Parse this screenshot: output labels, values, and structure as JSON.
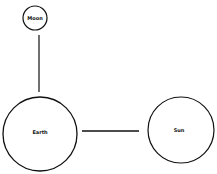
{
  "diagram": {
    "nodes": [
      {
        "id": "moon",
        "label": "Moon",
        "cx": 35,
        "cy": 18,
        "r": 12
      },
      {
        "id": "earth",
        "label": "Earth",
        "cx": 40,
        "cy": 134,
        "r": 37
      },
      {
        "id": "sun",
        "label": "Sun",
        "cx": 181,
        "cy": 130,
        "r": 33
      }
    ],
    "edges": [
      {
        "from": "moon",
        "to": "earth",
        "orientation": "vertical"
      },
      {
        "from": "earth",
        "to": "sun",
        "orientation": "horizontal"
      }
    ],
    "colors": {
      "stroke": "#111111",
      "background": "#ffffff"
    }
  }
}
